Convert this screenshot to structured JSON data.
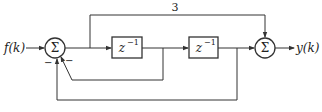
{
  "diagram": {
    "type": "block-diagram",
    "input_label": "f(k)",
    "output_label": "y(k)",
    "summer_symbol": "Σ",
    "delay_label": "z",
    "delay_exponent": "−1",
    "feedforward_gain": "3",
    "summer1_signs": [
      "−",
      "−"
    ],
    "blocks": [
      {
        "id": "summer-1",
        "label": "Σ"
      },
      {
        "id": "delay-1",
        "label": "z^-1"
      },
      {
        "id": "delay-2",
        "label": "z^-1"
      },
      {
        "id": "summer-2",
        "label": "Σ"
      }
    ],
    "colors": {
      "line": "#333333",
      "background": "#ffffff"
    }
  }
}
